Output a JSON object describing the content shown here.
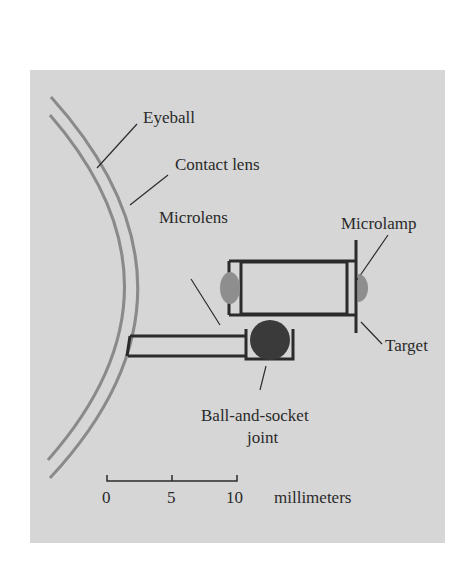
{
  "labels": {
    "eyeball": "Eyeball",
    "contact_lens": "Contact lens",
    "microlens": "Microlens",
    "microlamp": "Microlamp",
    "target": "Target",
    "joint_line1": "Ball-and-socket",
    "joint_line2": "joint"
  },
  "scale_bar": {
    "ticks": [
      "0",
      "5",
      "10"
    ],
    "unit": "millimeters"
  },
  "colors": {
    "panel": "#d6d6d6",
    "stroke": "#2b2b2b",
    "curve": "#8a8a8a",
    "lens_fill": "#8e8e8e",
    "ball_fill": "#3a3a3a"
  }
}
